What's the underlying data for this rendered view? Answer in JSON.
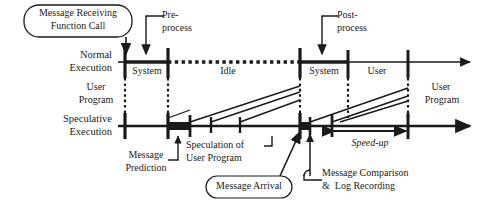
{
  "figure": {
    "type": "timeline-diagram"
  },
  "axes": {
    "normal": {
      "label_line1": "Normal",
      "label_line2": "Execution",
      "y": 62,
      "x_start": 118,
      "x_end": 470
    },
    "speculative": {
      "label_line1": "Speculative",
      "label_line2": "Execution",
      "y": 126,
      "x_start": 118,
      "x_end": 470
    }
  },
  "normal_segments": [
    {
      "name": "user-program-left",
      "label": "User\nProgram",
      "label_x": 95,
      "label_y": 80,
      "from": 118,
      "to": 125,
      "style": "solid-thin"
    },
    {
      "name": "system-1",
      "label": "System",
      "label_x": 126,
      "label_y": 66,
      "from": 125,
      "to": 168,
      "style": "solid-thick"
    },
    {
      "name": "idle",
      "label": "Idle",
      "label_x": 215,
      "label_y": 66,
      "from": 168,
      "to": 300,
      "style": "dotted-thick"
    },
    {
      "name": "system-2",
      "label": "System",
      "label_x": 301,
      "label_y": 66,
      "from": 300,
      "to": 348,
      "style": "solid-thick"
    },
    {
      "name": "user",
      "label": "User",
      "label_x": 358,
      "label_y": 66,
      "from": 348,
      "to": 408,
      "style": "solid-thin"
    },
    {
      "name": "user-program-right",
      "label": "User\nProgram",
      "label_x": 420,
      "label_y": 80,
      "from": 408,
      "to": 470,
      "style": "solid-thin"
    }
  ],
  "normal_ticks": [
    125,
    168,
    300,
    348,
    408
  ],
  "speculative_ticks": [
    125,
    168,
    190,
    211,
    240,
    300,
    310,
    332,
    408
  ],
  "speculative_blocks": [
    {
      "name": "message-prediction-block",
      "from": 167,
      "to": 190
    },
    {
      "name": "message-comparison-block",
      "from": 299,
      "to": 311
    }
  ],
  "callouts": [
    {
      "name": "message-receiving-function-call",
      "line1": "Message Receiving",
      "line2": "Function Call",
      "x": 24,
      "y": 5,
      "w": 108,
      "h": 32
    },
    {
      "name": "message-arrival",
      "line1": "Message Arrival",
      "line2": "",
      "x": 206,
      "y": 176,
      "w": 86,
      "h": 22
    }
  ],
  "annotations": [
    {
      "name": "pre-process",
      "line1": "Pre-",
      "line2": "process",
      "x": 166,
      "y": 10
    },
    {
      "name": "post-process",
      "line1": "Post-",
      "line2": "process",
      "x": 340,
      "y": 10
    },
    {
      "name": "message-prediction",
      "line1": "Message",
      "line2": "Prediction",
      "x": 122,
      "y": 150
    },
    {
      "name": "speculation-of-user-program",
      "line1": "Speculation of",
      "line2": "User Program",
      "x": 190,
      "y": 141
    },
    {
      "name": "message-comparison-log-recording",
      "line1": "Message Comparison",
      "line2": "&  Log Recording",
      "x": 330,
      "y": 168
    },
    {
      "name": "speed-up",
      "line1": "Speed-up",
      "line2": "",
      "x": 345,
      "y": 140
    }
  ],
  "measure": {
    "speed_up_label": "Speed-up",
    "from": 332,
    "to": 408,
    "y": 131
  },
  "colors": {
    "stroke": "#1a1a1a",
    "background": "#ffffff"
  }
}
